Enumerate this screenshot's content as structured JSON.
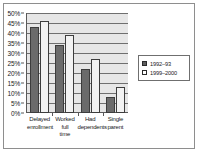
{
  "chart_data": {
    "type": "bar",
    "title": "",
    "subtitle": "",
    "xlabel": "",
    "ylabel": "",
    "categories": [
      "Delayed enrollment",
      "Worked full time",
      "Had dependents",
      "Single parent"
    ],
    "category_lines": [
      [
        "Delayed",
        "enrollment"
      ],
      [
        "Worked",
        "full",
        "time"
      ],
      [
        "Had",
        "dependents"
      ],
      [
        "Single",
        "parent"
      ]
    ],
    "series": [
      {
        "name": "1992–93",
        "color": "#6b6b6b",
        "values": [
          43,
          34,
          22,
          8
        ]
      },
      {
        "name": "1999–2000",
        "color": "#f2f2f2",
        "values": [
          46,
          39,
          27,
          13
        ]
      }
    ],
    "ylim": [
      0,
      50
    ],
    "ytick_values": [
      0,
      5,
      10,
      15,
      20,
      25,
      30,
      35,
      40,
      45,
      50
    ],
    "ytick_labels": [
      "0%",
      "5%",
      "10%",
      "15%",
      "20%",
      "25%",
      "30%",
      "35%",
      "40%",
      "45%",
      "50%"
    ],
    "grid": true,
    "grid_axis": "y",
    "legend_position": "right",
    "plot_background": "#e6e6e6",
    "figure_background": "#ffffff",
    "axis_color": "#595959"
  }
}
